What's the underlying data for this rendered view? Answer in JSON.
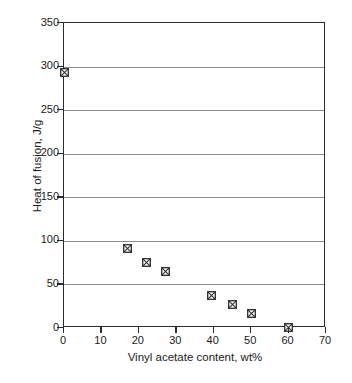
{
  "chart_data": {
    "type": "scatter",
    "title": "",
    "xlabel": "Vinyl acetate content, wt%",
    "ylabel": "Heat of fusion, J/g",
    "xlim": [
      0,
      70
    ],
    "ylim": [
      0,
      350
    ],
    "xticks": [
      0,
      10,
      20,
      30,
      40,
      50,
      60,
      70
    ],
    "yticks": [
      0,
      50,
      100,
      150,
      200,
      250,
      300,
      350
    ],
    "xtick_labels": [
      "0",
      "10",
      "20",
      "30",
      "40",
      "50",
      "60",
      "70"
    ],
    "ytick_labels": [
      "0",
      "50",
      "100",
      "150",
      "200",
      "250",
      "300",
      "350"
    ],
    "grid": "horizontal",
    "legend": "none",
    "marker_style": "crossed-square",
    "marker_color": "#2b2b2b",
    "series": [
      {
        "name": "Heat of fusion",
        "points": [
          {
            "x": 0,
            "y": 293
          },
          {
            "x": 17,
            "y": 91
          },
          {
            "x": 22,
            "y": 75
          },
          {
            "x": 27,
            "y": 65
          },
          {
            "x": 39.5,
            "y": 37
          },
          {
            "x": 45,
            "y": 27
          },
          {
            "x": 50,
            "y": 17
          },
          {
            "x": 60,
            "y": 1
          }
        ]
      }
    ]
  },
  "colors": {
    "axis": "#2b2b2b",
    "grid": "#8a8a8a",
    "background": "#ffffff",
    "text": "#1a1a1a"
  }
}
